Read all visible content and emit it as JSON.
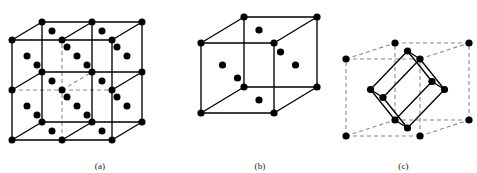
{
  "figure": {
    "kind": "crystal-lattice-diagram",
    "background_color": "#ffffff",
    "atom_color": "#000000",
    "solid_edge_color": "#000000",
    "dashed_edge_color": "#8a8a8a"
  },
  "panels": [
    {
      "id": "a",
      "caption": "(a)",
      "title": "fcc lattice array",
      "cells_x": 2,
      "cells_y": 2,
      "cells_z": 1,
      "origin": [
        12,
        140
      ],
      "axis_x": [
        50,
        0
      ],
      "axis_y": [
        0,
        -50
      ],
      "axis_z": [
        30,
        -18
      ],
      "atom_radius": 3.5
    },
    {
      "id": "b",
      "caption": "(b)",
      "title": "fcc conventional unit cell",
      "cells_x": 1,
      "cells_y": 1,
      "cells_z": 1,
      "origin": [
        11,
        113
      ],
      "axis_x": [
        73,
        0
      ],
      "axis_y": [
        0,
        -70
      ],
      "axis_z": [
        43,
        -26
      ],
      "atom_radius": 3.6
    },
    {
      "id": "c",
      "caption": "(c)",
      "title": "fcc primitive rhombohedral cell",
      "cells_x": 1,
      "cells_y": 1,
      "cells_z": 1,
      "origin": [
        16,
        136
      ],
      "axis_x": [
        74,
        0
      ],
      "axis_y": [
        0,
        -77
      ],
      "axis_z": [
        49,
        -16
      ],
      "atom_radius": 3.6
    }
  ],
  "chart_data": {
    "type": "diagram",
    "subplots": [
      {
        "label": "(a)",
        "content": "Array of 2 x 2 x 1 fcc conventional unit cells",
        "corner_sites": 18,
        "face_centre_sites_per_cell": 6
      },
      {
        "label": "(b)",
        "content": "Single fcc conventional cubic unit cell",
        "corner_sites": 8,
        "face_centre_sites": 6,
        "lattice_points_per_cell": 4
      },
      {
        "label": "(c)",
        "content": "Primitive rhombohedral cell of the fcc lattice drawn inside the dashed cubic cell",
        "primitive_vectors": 3,
        "lattice_points_per_primitive_cell": 1
      }
    ]
  }
}
